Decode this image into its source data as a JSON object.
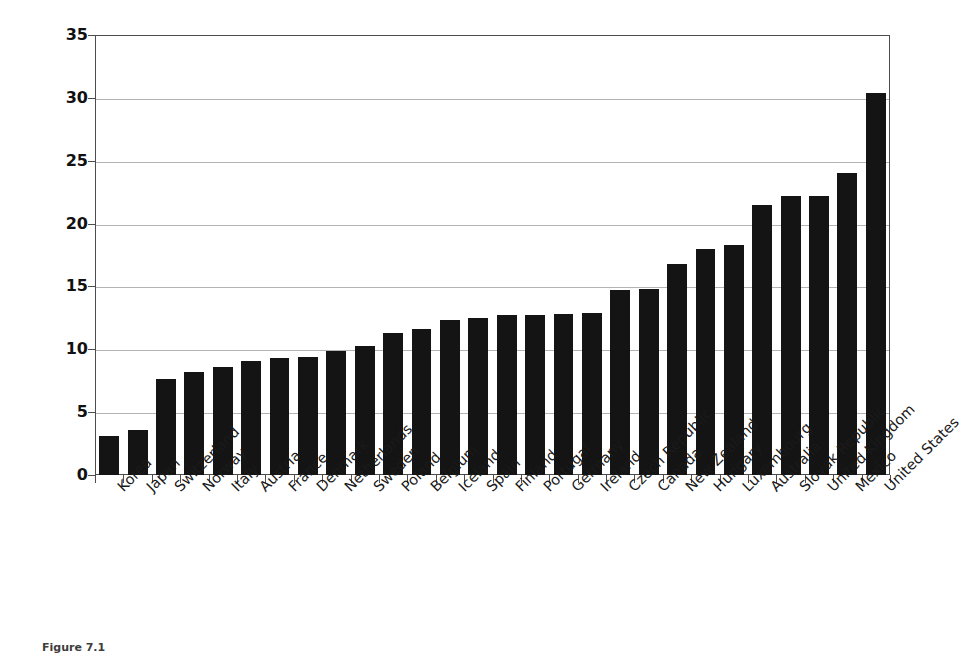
{
  "chart_data": {
    "type": "bar",
    "title": "",
    "xlabel": "",
    "ylabel": "Percent of population",
    "ylim": [
      0,
      35
    ],
    "yticks": [
      0,
      5,
      10,
      15,
      20,
      25,
      30,
      35
    ],
    "grid": true,
    "legend": "none",
    "bar_color": "#141414",
    "categories": [
      "Korea",
      "Japan",
      "Switzerland",
      "Norway",
      "Italy",
      "Austria",
      "France",
      "Denmark",
      "Netherlands",
      "Sweden",
      "Poland",
      "Belgium",
      "Iceland",
      "Spain",
      "Finland",
      "Portugal",
      "Germany",
      "Ireland",
      "Czech Republic",
      "Canada",
      "New Zealand",
      "Hungary",
      "Luxembourg",
      "Australia",
      "Slovak Republic",
      "United Kingdom",
      "Mexico",
      "United States"
    ],
    "values": [
      3.1,
      3.6,
      7.6,
      8.2,
      8.6,
      9.1,
      9.3,
      9.4,
      9.9,
      10.3,
      11.3,
      11.6,
      12.3,
      12.5,
      12.7,
      12.7,
      12.8,
      12.9,
      14.7,
      14.8,
      16.8,
      18.0,
      18.3,
      21.5,
      22.2,
      22.2,
      24.0,
      30.4
    ]
  },
  "axis": {
    "y_title": "Percent of population"
  },
  "caption": {
    "text": "Figure 7.1"
  },
  "colors": {
    "bar": "#141414",
    "grid": "#b3b3b3",
    "frame": "#4d4d4d",
    "background": "#ffffff"
  }
}
